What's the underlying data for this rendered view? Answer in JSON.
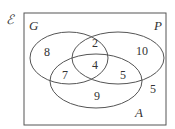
{
  "diagram": {
    "universal_symbol": "ℰ",
    "sets": [
      {
        "name": "G",
        "label": "G"
      },
      {
        "name": "P",
        "label": "P"
      },
      {
        "name": "A",
        "label": "A"
      }
    ],
    "regions": {
      "G_only": "8",
      "P_only": "10",
      "G_and_P_only": "2",
      "G_and_P_and_A": "4",
      "G_and_A_only": "7",
      "P_and_A_only": "5",
      "A_only": "9",
      "outside": "5"
    }
  }
}
